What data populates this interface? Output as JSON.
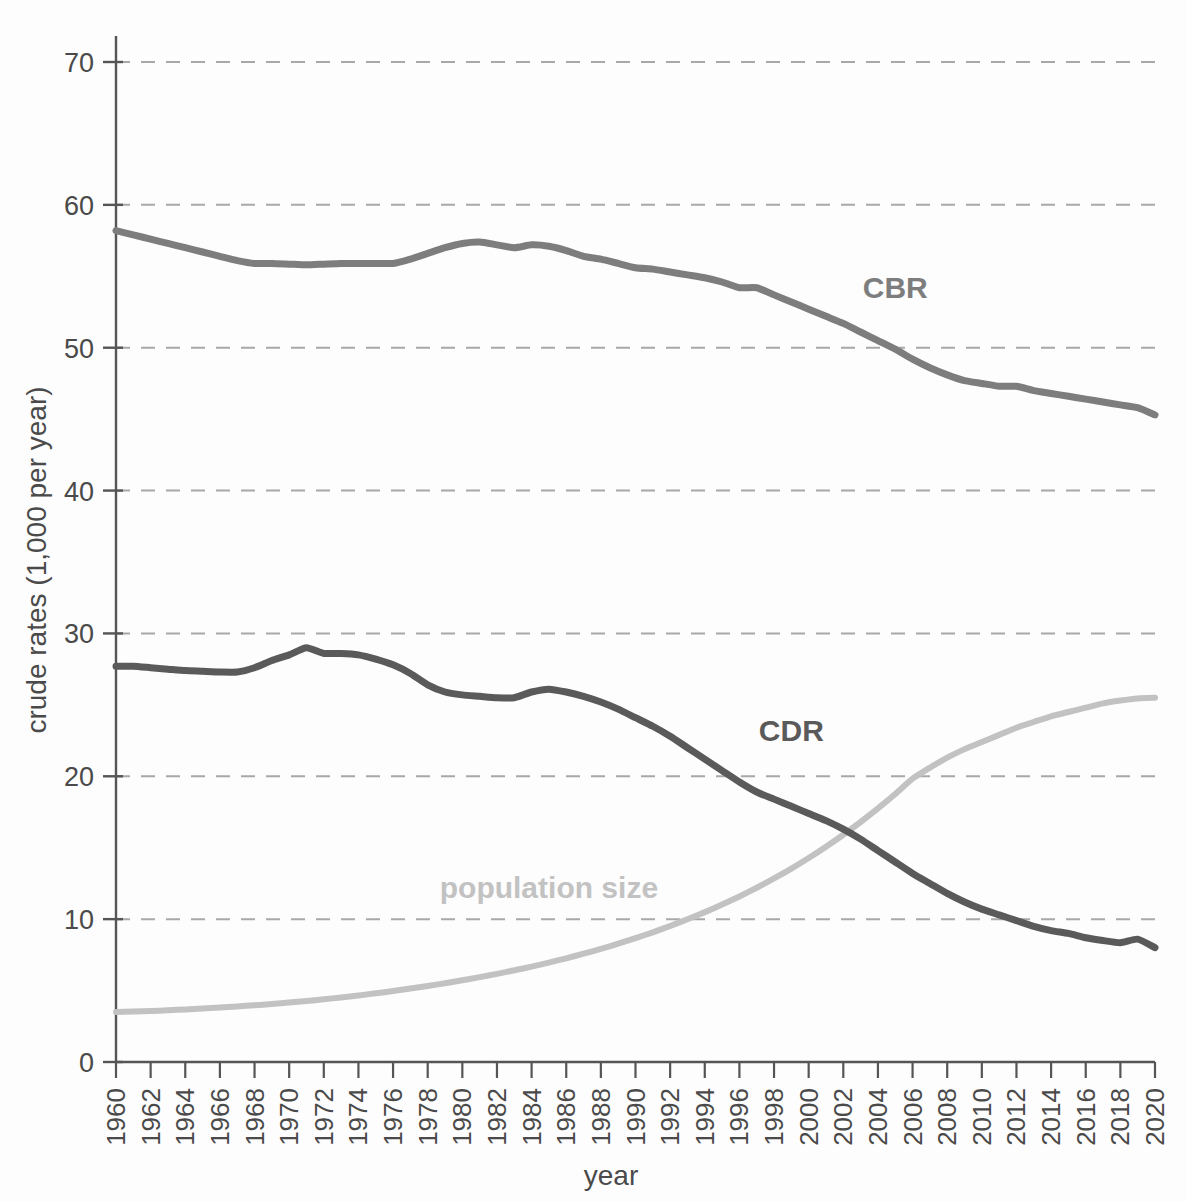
{
  "chart_data": {
    "type": "line",
    "title": "",
    "xlabel": "year",
    "ylabel": "crude rates (1,000 per year)",
    "xlim": [
      1960,
      2020
    ],
    "ylim": [
      0,
      70
    ],
    "yticks": [
      0,
      10,
      20,
      30,
      40,
      50,
      60,
      70
    ],
    "xticks": [
      1960,
      1962,
      1964,
      1966,
      1968,
      1970,
      1972,
      1974,
      1976,
      1978,
      1980,
      1982,
      1984,
      1986,
      1988,
      1990,
      1992,
      1994,
      1996,
      1998,
      2000,
      2002,
      2004,
      2006,
      2008,
      2010,
      2012,
      2014,
      2016,
      2018,
      2020
    ],
    "grid": "horizontal-dashed",
    "legend": "inline-annotations",
    "x": [
      1960,
      1961,
      1962,
      1963,
      1964,
      1965,
      1966,
      1967,
      1968,
      1969,
      1970,
      1971,
      1972,
      1973,
      1974,
      1975,
      1976,
      1977,
      1978,
      1979,
      1980,
      1981,
      1982,
      1983,
      1984,
      1985,
      1986,
      1987,
      1988,
      1989,
      1990,
      1991,
      1992,
      1993,
      1994,
      1995,
      1996,
      1997,
      1998,
      1999,
      2000,
      2001,
      2002,
      2003,
      2004,
      2005,
      2006,
      2007,
      2008,
      2009,
      2010,
      2011,
      2012,
      2013,
      2014,
      2015,
      2016,
      2017,
      2018,
      2019,
      2020
    ],
    "series": [
      {
        "name": "CBR",
        "label": "CBR",
        "color": "#7d7d7d",
        "unit": "per 1,000 per year",
        "values": [
          58.2,
          57.9,
          57.6,
          57.3,
          57.0,
          56.7,
          56.4,
          56.1,
          55.9,
          55.9,
          55.85,
          55.8,
          55.85,
          55.9,
          55.9,
          55.9,
          55.9,
          56.2,
          56.6,
          57.0,
          57.3,
          57.4,
          57.2,
          57.0,
          57.2,
          57.1,
          56.8,
          56.4,
          56.2,
          55.9,
          55.6,
          55.5,
          55.3,
          55.1,
          54.9,
          54.6,
          54.2,
          54.2,
          53.7,
          53.2,
          52.7,
          52.2,
          51.7,
          51.1,
          50.5,
          49.9,
          49.2,
          48.6,
          48.1,
          47.7,
          47.5,
          47.3,
          47.3,
          47.0,
          46.8,
          46.6,
          46.4,
          46.2,
          46.0,
          45.8,
          45.3
        ]
      },
      {
        "name": "CDR",
        "label": "CDR",
        "color": "#5a5a5a",
        "unit": "per 1,000 per year",
        "values": [
          27.7,
          27.7,
          27.6,
          27.5,
          27.4,
          27.35,
          27.3,
          27.3,
          27.6,
          28.1,
          28.5,
          29.0,
          28.6,
          28.6,
          28.5,
          28.2,
          27.8,
          27.2,
          26.4,
          25.9,
          25.7,
          25.6,
          25.5,
          25.5,
          25.9,
          26.1,
          25.9,
          25.6,
          25.2,
          24.7,
          24.1,
          23.5,
          22.8,
          22.0,
          21.2,
          20.4,
          19.6,
          18.9,
          18.4,
          17.9,
          17.4,
          16.9,
          16.3,
          15.6,
          14.8,
          14.0,
          13.2,
          12.5,
          11.8,
          11.2,
          10.7,
          10.3,
          9.9,
          9.5,
          9.2,
          9.0,
          8.7,
          8.5,
          8.35,
          8.6,
          8.0
        ]
      },
      {
        "name": "population size",
        "label": "population size",
        "color": "#c2c2c2",
        "unit": "relative (scaled)",
        "values": [
          3.5,
          3.53,
          3.57,
          3.62,
          3.68,
          3.74,
          3.81,
          3.89,
          3.97,
          4.06,
          4.16,
          4.27,
          4.39,
          4.52,
          4.66,
          4.81,
          4.97,
          5.14,
          5.32,
          5.51,
          5.72,
          5.94,
          6.17,
          6.42,
          6.68,
          6.96,
          7.26,
          7.58,
          7.92,
          8.28,
          8.67,
          9.08,
          9.52,
          9.99,
          10.49,
          11.02,
          11.59,
          12.2,
          12.85,
          13.54,
          14.28,
          15.07,
          15.91,
          16.8,
          17.75,
          18.76,
          19.83,
          20.6,
          21.3,
          21.9,
          22.4,
          22.9,
          23.4,
          23.8,
          24.2,
          24.5,
          24.8,
          25.1,
          25.3,
          25.45,
          25.5
        ]
      }
    ],
    "annotations": [
      {
        "text": "CBR",
        "x": 2005,
        "y": 53.5,
        "color": "#7d7d7d"
      },
      {
        "text": "CDR",
        "x": 1999,
        "y": 22.5,
        "color": "#5a5a5a"
      },
      {
        "text": "population size",
        "x": 1985,
        "y": 11.5,
        "color": "#c2c2c2"
      }
    ]
  },
  "axes": {
    "y_title": "crude rates (1,000 per year)",
    "x_title": "year",
    "y_tick_labels": [
      "0",
      "10",
      "20",
      "30",
      "40",
      "50",
      "60",
      "70"
    ],
    "x_tick_labels": [
      "1960",
      "1962",
      "1964",
      "1966",
      "1968",
      "1970",
      "1972",
      "1974",
      "1976",
      "1978",
      "1980",
      "1982",
      "1984",
      "1986",
      "1988",
      "1990",
      "1992",
      "1994",
      "1996",
      "1998",
      "2000",
      "2002",
      "2004",
      "2006",
      "2008",
      "2010",
      "2012",
      "2014",
      "2016",
      "2018",
      "2020"
    ]
  },
  "colors": {
    "cbr": "#7d7d7d",
    "cdr": "#5a5a5a",
    "population": "#c2c2c2",
    "grid": "#a8a8a8",
    "axis": "#555555",
    "text": "#4a4a4a",
    "background": "#fdfdfd"
  }
}
